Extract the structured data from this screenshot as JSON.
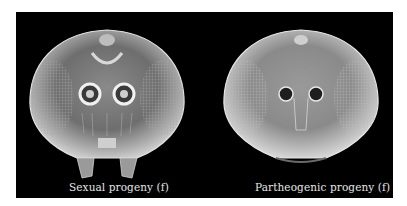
{
  "figure": {
    "background": "#000000",
    "panels": [
      {
        "label": "Sexual progeny (f)",
        "subject": "wasp-head-sem-micrograph"
      },
      {
        "label": "Partheogenic progeny (f)",
        "subject": "wasp-head-sem-micrograph"
      }
    ]
  }
}
